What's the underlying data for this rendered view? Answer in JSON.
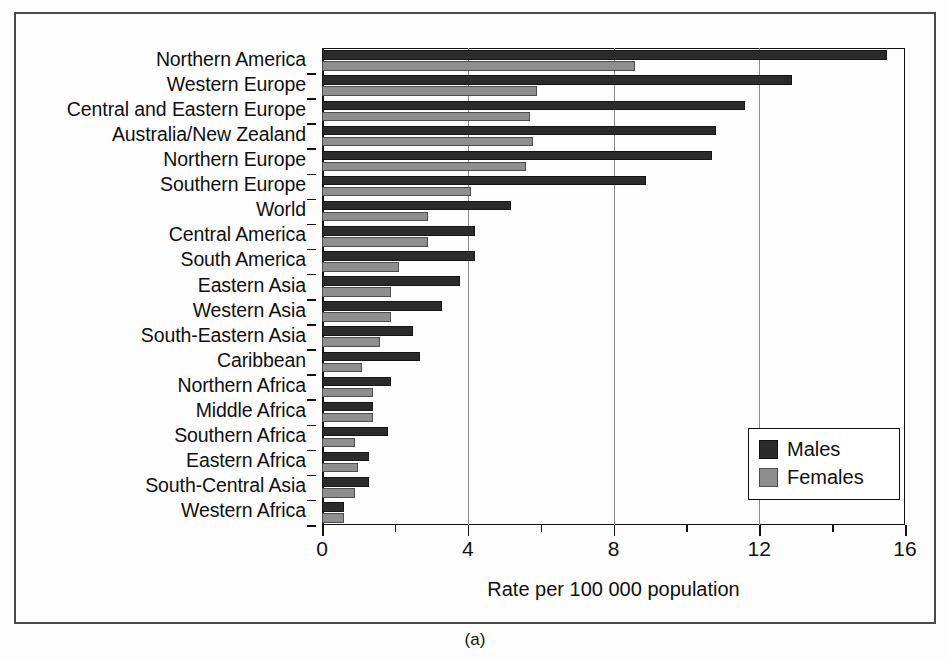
{
  "figure": {
    "caption": "(a)"
  },
  "chart_data": {
    "type": "bar",
    "orientation": "horizontal",
    "title": "",
    "xlabel": "Rate per 100 000 population",
    "ylabel": "",
    "xlim": [
      0,
      16
    ],
    "xticks": [
      0,
      4,
      8,
      12,
      16
    ],
    "xtick_labels": [
      "0",
      "4",
      "8",
      "12",
      "16"
    ],
    "minor_tick_step": 2,
    "grid": "vertical",
    "legend_position": "lower-right",
    "categories": [
      "Northern America",
      "Western Europe",
      "Central and Eastern Europe",
      "Australia/New Zealand",
      "Northern Europe",
      "Southern Europe",
      "World",
      "Central America",
      "South America",
      "Eastern Asia",
      "Western Asia",
      "South-Eastern Asia",
      "Caribbean",
      "Northern Africa",
      "Middle Africa",
      "Southern Africa",
      "Eastern Africa",
      "South-Central Asia",
      "Western Africa"
    ],
    "series": [
      {
        "name": "Males",
        "color": "#2b2b2b",
        "values": [
          15.5,
          12.9,
          11.6,
          10.8,
          10.7,
          8.9,
          5.2,
          4.2,
          4.2,
          3.8,
          3.3,
          2.5,
          2.7,
          1.9,
          1.4,
          1.8,
          1.3,
          1.3,
          0.6
        ]
      },
      {
        "name": "Females",
        "color": "#8e8e8e",
        "values": [
          8.6,
          5.9,
          5.7,
          5.8,
          5.6,
          4.1,
          2.9,
          2.9,
          2.1,
          1.9,
          1.9,
          1.6,
          1.1,
          1.4,
          1.4,
          0.9,
          1.0,
          0.9,
          0.6
        ]
      }
    ]
  }
}
